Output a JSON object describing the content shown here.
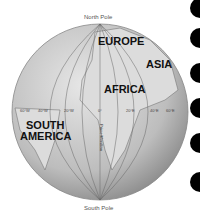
{
  "map": {
    "title": "Globe showing Prime Meridian",
    "poles": {
      "north": "North Pole",
      "south": "South Pole"
    },
    "continents": [
      {
        "name": "EUROPE",
        "x": 98,
        "y": 36
      },
      {
        "name": "ASIA",
        "x": 146,
        "y": 59
      },
      {
        "name": "AFRICA",
        "x": 104,
        "y": 84
      },
      {
        "name": "SOUTH",
        "x": 26,
        "y": 120
      },
      {
        "name": "AMERICA",
        "x": 20,
        "y": 131
      }
    ],
    "longitude_labels": [
      "60°W",
      "40°W",
      "20°W",
      "0°",
      "20°E",
      "40°E",
      "60°E"
    ],
    "meridian_label": "Prime Meridian",
    "colors": {
      "globe": "#c8c8c8",
      "land": "#e2e2e2",
      "lines": "#666666",
      "dots": "#000000"
    }
  }
}
